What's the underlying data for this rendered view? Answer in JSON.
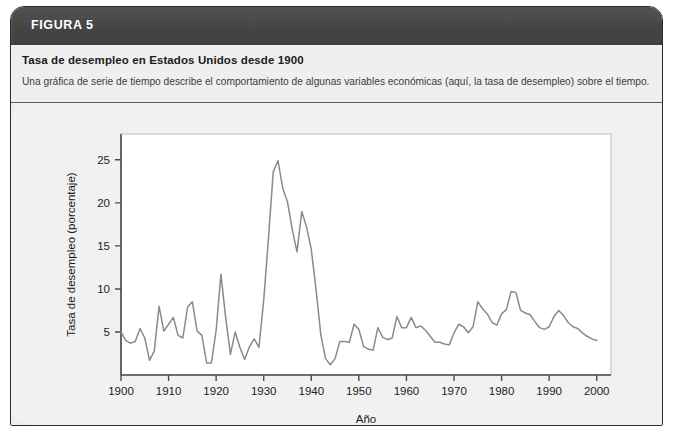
{
  "figure": {
    "header_label": "FIGURA 5",
    "title": "Tasa de desempleo en Estados Unidos desde 1900",
    "subtitle": "Una gráfica de serie de tiempo describe el comportamiento de algunas variables económicas (aquí, la tasa de desempleo) sobre el tiempo.",
    "header_bg": "#4a4a4a",
    "caption_bg": "#efefef",
    "panel_bg": "#f1f1f1",
    "border_color": "#2b2b2b"
  },
  "chart_data": {
    "type": "line",
    "title": "Tasa de desempleo en Estados Unidos desde 1900",
    "xlabel": "Año",
    "ylabel": "Tasa de desempleo (porcentaje)",
    "xlim": [
      1900,
      2003
    ],
    "ylim": [
      0,
      28
    ],
    "xticks": [
      1900,
      1910,
      1920,
      1930,
      1940,
      1950,
      1960,
      1970,
      1980,
      1990,
      2000
    ],
    "xtick_labels": [
      "1900",
      "1910",
      "1920",
      "1930",
      "1940",
      "1950",
      "1960",
      "1970",
      "1980",
      "1990",
      "2000"
    ],
    "yticks": [
      5,
      10,
      15,
      20,
      25
    ],
    "ytick_labels": [
      "5",
      "10",
      "15",
      "20",
      "25"
    ],
    "grid": false,
    "legend": "none",
    "line_color": "#8a8a8a",
    "plot_bg": "#ffffff",
    "axis_color": "#4a4a4a",
    "series": [
      {
        "name": "Tasa de desempleo",
        "x": [
          1900,
          1901,
          1902,
          1903,
          1904,
          1905,
          1906,
          1907,
          1908,
          1909,
          1910,
          1911,
          1912,
          1913,
          1914,
          1915,
          1916,
          1917,
          1918,
          1919,
          1920,
          1921,
          1922,
          1923,
          1924,
          1925,
          1926,
          1927,
          1928,
          1929,
          1930,
          1931,
          1932,
          1933,
          1934,
          1935,
          1936,
          1937,
          1938,
          1939,
          1940,
          1941,
          1942,
          1943,
          1944,
          1945,
          1946,
          1947,
          1948,
          1949,
          1950,
          1951,
          1952,
          1953,
          1954,
          1955,
          1956,
          1957,
          1958,
          1959,
          1960,
          1961,
          1962,
          1963,
          1964,
          1965,
          1966,
          1967,
          1968,
          1969,
          1970,
          1971,
          1972,
          1973,
          1974,
          1975,
          1976,
          1977,
          1978,
          1979,
          1980,
          1981,
          1982,
          1983,
          1984,
          1985,
          1986,
          1987,
          1988,
          1989,
          1990,
          1991,
          1992,
          1993,
          1994,
          1995,
          1996,
          1997,
          1998,
          1999,
          2000
        ],
        "values": [
          5.0,
          4.0,
          3.7,
          3.9,
          5.4,
          4.3,
          1.7,
          2.8,
          8.0,
          5.1,
          5.9,
          6.7,
          4.6,
          4.3,
          7.9,
          8.5,
          5.1,
          4.6,
          1.4,
          1.4,
          5.2,
          11.7,
          6.7,
          2.4,
          5.0,
          3.2,
          1.8,
          3.3,
          4.2,
          3.2,
          8.7,
          15.9,
          23.6,
          24.9,
          21.7,
          20.1,
          16.9,
          14.3,
          19.0,
          17.2,
          14.6,
          9.9,
          4.7,
          1.9,
          1.2,
          1.9,
          3.9,
          3.9,
          3.8,
          5.9,
          5.3,
          3.3,
          3.0,
          2.9,
          5.5,
          4.4,
          4.1,
          4.3,
          6.8,
          5.5,
          5.5,
          6.7,
          5.5,
          5.7,
          5.2,
          4.5,
          3.8,
          3.8,
          3.6,
          3.5,
          4.9,
          5.9,
          5.6,
          4.9,
          5.6,
          8.5,
          7.7,
          7.1,
          6.1,
          5.8,
          7.1,
          7.6,
          9.7,
          9.6,
          7.5,
          7.2,
          7.0,
          6.2,
          5.5,
          5.3,
          5.6,
          6.8,
          7.5,
          6.9,
          6.1,
          5.6,
          5.4,
          4.9,
          4.5,
          4.2,
          4.0
        ]
      }
    ]
  }
}
